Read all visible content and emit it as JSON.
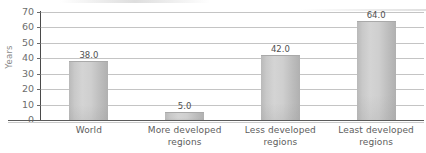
{
  "chart_data": {
    "type": "bar",
    "title": "",
    "xlabel": "",
    "ylabel": "Years",
    "ylim": [
      0,
      70
    ],
    "ytick_step": 10,
    "yticks": [
      "70",
      "60",
      "50",
      "40",
      "30",
      "20",
      "10",
      "0"
    ],
    "grid": true,
    "legend": "none",
    "categories": [
      "World",
      "More developed regions",
      "Less developed regions",
      "Least developed regions"
    ],
    "category_lines": [
      [
        "World"
      ],
      [
        "More developed",
        "regions"
      ],
      [
        "Less developed",
        "regions"
      ],
      [
        "Least developed",
        "regions"
      ]
    ],
    "values": [
      38.0,
      5.0,
      42.0,
      64.0
    ],
    "data_labels": [
      "38.0",
      "5.0",
      "42.0",
      "64.0"
    ],
    "colors": {
      "bar_fill": "#cccccc",
      "bar_edge": "#a9a9a9",
      "gridline": "#c4c4c4",
      "axis": "#4a4a4a",
      "text": "#5d5d5d"
    }
  }
}
